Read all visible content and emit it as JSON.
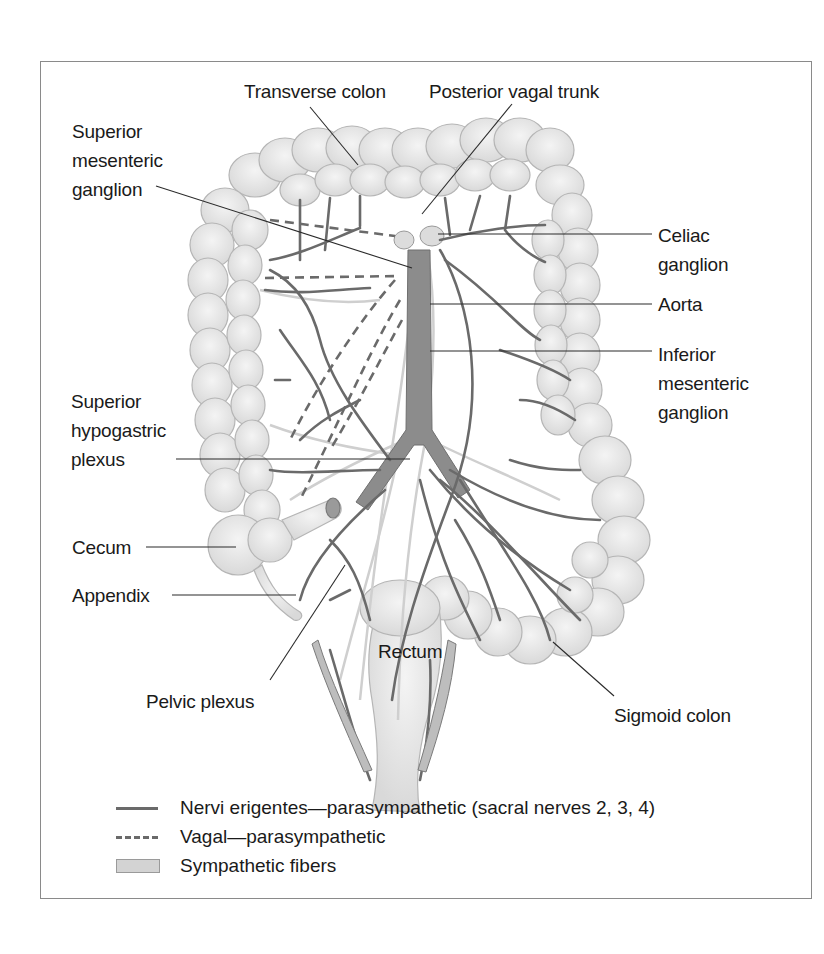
{
  "figure": {
    "labels": {
      "transverse_colon": "Transverse colon",
      "posterior_vagal_trunk": "Posterior vagal trunk",
      "superior_mesenteric_ganglion": "Superior\nmesenteric\nganglion",
      "celiac_ganglion": "Celiac\nganglion",
      "aorta": "Aorta",
      "inferior_mesenteric_ganglion": "Inferior\nmesenteric\nganglion",
      "superior_hypogastric_plexus": "Superior\nhypogastric\nplexus",
      "cecum": "Cecum",
      "appendix": "Appendix",
      "rectum": "Rectum",
      "pelvic_plexus": "Pelvic plexus",
      "sigmoid_colon": "Sigmoid colon"
    },
    "legend": [
      {
        "key": "solid-line",
        "label": "Nervi erigentes—parasympathetic (sacral nerves 2, 3, 4)"
      },
      {
        "key": "dashed-line",
        "label": "Vagal—parasympathetic"
      },
      {
        "key": "filled-box",
        "label": "Sympathetic fibers"
      }
    ],
    "colors": {
      "nerve": "#6a6a6a",
      "colon_fill": "#e4e4e4",
      "colon_stroke": "#b5b5b5",
      "sympathetic": "#d3d3d3",
      "frame": "#8a8a8a"
    }
  }
}
